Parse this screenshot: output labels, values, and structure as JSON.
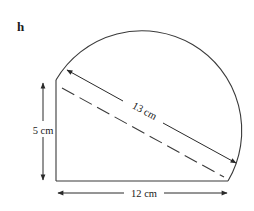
{
  "figure": {
    "label": "h",
    "dimensions": {
      "height": "5 cm",
      "width": "12 cm",
      "diagonal": "13 cm"
    },
    "colors": {
      "stroke": "#3a3a3a",
      "text": "#1a1a1a",
      "background": "#ffffff"
    }
  }
}
